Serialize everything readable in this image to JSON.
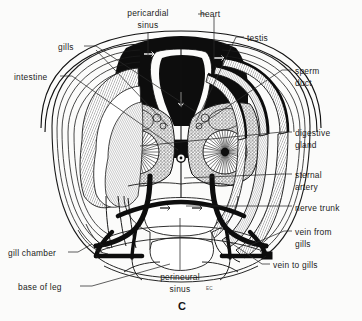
{
  "figure": {
    "caption_letter": "C",
    "artist_mark": "EC",
    "background_color": "#fbfbfa",
    "ink_color": "#111111"
  },
  "labels": [
    {
      "id": "pericardial-sinus",
      "lines": [
        "pericardial",
        "sinus"
      ],
      "x": 148,
      "y": 8,
      "align": "center"
    },
    {
      "id": "heart",
      "lines": [
        "heart"
      ],
      "x": 200,
      "y": 9,
      "align": "left"
    },
    {
      "id": "testis",
      "lines": [
        "testis"
      ],
      "x": 247,
      "y": 33,
      "align": "left"
    },
    {
      "id": "gills",
      "lines": [
        "gills"
      ],
      "x": 58,
      "y": 42,
      "align": "left"
    },
    {
      "id": "sperm-duct",
      "lines": [
        "sperm",
        "duct"
      ],
      "x": 295,
      "y": 66,
      "align": "left"
    },
    {
      "id": "intestine",
      "lines": [
        "intestine"
      ],
      "x": 14,
      "y": 72,
      "align": "left"
    },
    {
      "id": "digestive-gland",
      "lines": [
        "digestive",
        "gland"
      ],
      "x": 295,
      "y": 128,
      "align": "left"
    },
    {
      "id": "sternal-artery",
      "lines": [
        "sternal",
        "artery"
      ],
      "x": 295,
      "y": 170,
      "align": "left"
    },
    {
      "id": "nerve-trunk",
      "lines": [
        "nerve trunk"
      ],
      "x": 295,
      "y": 203,
      "align": "left"
    },
    {
      "id": "vein-from-gills",
      "lines": [
        "vein from",
        "gills"
      ],
      "x": 295,
      "y": 227,
      "align": "left"
    },
    {
      "id": "gill-chamber",
      "lines": [
        "gill chamber"
      ],
      "x": 8,
      "y": 248,
      "align": "left"
    },
    {
      "id": "vein-to-gills",
      "lines": [
        "vein to gills"
      ],
      "x": 273,
      "y": 260,
      "align": "left"
    },
    {
      "id": "perineural-sinus",
      "lines": [
        "perineural",
        "sinus"
      ],
      "x": 180,
      "y": 272,
      "align": "center"
    },
    {
      "id": "base-of-leg",
      "lines": [
        "base of leg"
      ],
      "x": 18,
      "y": 282,
      "align": "left"
    }
  ]
}
